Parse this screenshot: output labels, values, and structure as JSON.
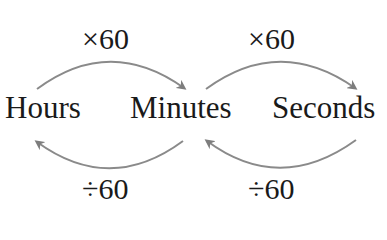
{
  "diagram": {
    "units": [
      {
        "id": "hours",
        "label": "Hours"
      },
      {
        "id": "minutes",
        "label": "Minutes"
      },
      {
        "id": "seconds",
        "label": "Seconds"
      }
    ],
    "conversions": [
      {
        "from": "hours",
        "to": "minutes",
        "operation": "×60",
        "direction": "forward"
      },
      {
        "from": "minutes",
        "to": "seconds",
        "operation": "×60",
        "direction": "forward"
      },
      {
        "from": "minutes",
        "to": "hours",
        "operation": "÷60",
        "direction": "backward"
      },
      {
        "from": "seconds",
        "to": "minutes",
        "operation": "÷60",
        "direction": "backward"
      }
    ],
    "arrow_color": "#8a8a8a",
    "text_color": "#1a1a1a"
  }
}
